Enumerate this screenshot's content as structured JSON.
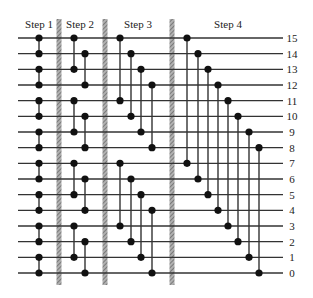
{
  "diagram": {
    "type": "sorting-network",
    "wires": 16,
    "wire_labels": [
      "15",
      "14",
      "13",
      "12",
      "11",
      "10",
      "9",
      "8",
      "7",
      "6",
      "5",
      "4",
      "3",
      "2",
      "1",
      "0"
    ],
    "steps": [
      {
        "label": "Step 1",
        "columns": [
          [
            [
              15,
              14
            ],
            [
              13,
              12
            ],
            [
              11,
              10
            ],
            [
              9,
              8
            ],
            [
              7,
              6
            ],
            [
              5,
              4
            ],
            [
              3,
              2
            ],
            [
              1,
              0
            ]
          ]
        ]
      },
      {
        "label": "Step 2",
        "columns": [
          [
            [
              15,
              13
            ],
            [
              11,
              9
            ],
            [
              7,
              5
            ],
            [
              3,
              1
            ]
          ],
          [
            [
              14,
              12
            ],
            [
              10,
              8
            ],
            [
              6,
              4
            ],
            [
              2,
              0
            ]
          ]
        ]
      },
      {
        "label": "Step 3",
        "columns": [
          [
            [
              15,
              11
            ],
            [
              7,
              3
            ]
          ],
          [
            [
              14,
              10
            ],
            [
              6,
              2
            ]
          ],
          [
            [
              13,
              9
            ],
            [
              5,
              1
            ]
          ],
          [
            [
              12,
              8
            ],
            [
              4,
              0
            ]
          ]
        ]
      },
      {
        "label": "Step 4",
        "columns": [
          [
            [
              15,
              7
            ]
          ],
          [
            [
              14,
              6
            ]
          ],
          [
            [
              13,
              5
            ]
          ],
          [
            [
              12,
              4
            ]
          ],
          [
            [
              11,
              3
            ]
          ],
          [
            [
              10,
              2
            ]
          ],
          [
            [
              9,
              1
            ]
          ],
          [
            [
              8,
              0
            ]
          ]
        ]
      }
    ],
    "colors": {
      "wire": "#333333",
      "node": "#111111",
      "divider": "#888888"
    }
  }
}
